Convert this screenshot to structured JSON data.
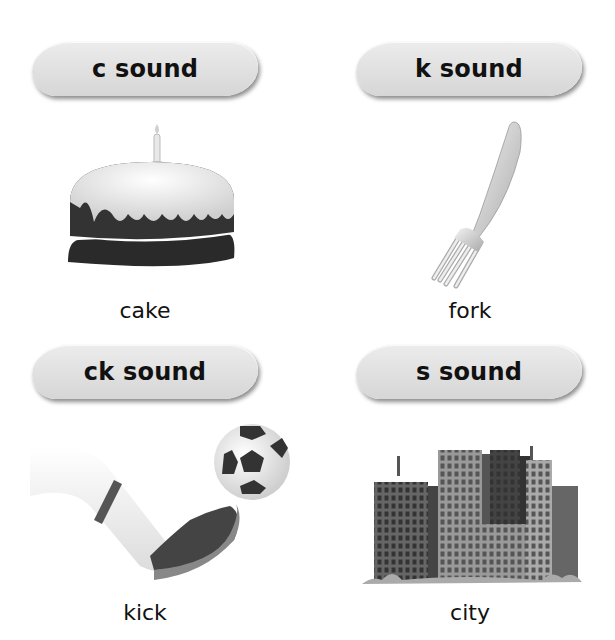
{
  "cards": [
    {
      "heading": "c sound",
      "word": "cake",
      "image": "cake-icon"
    },
    {
      "heading": "k sound",
      "word": "fork",
      "image": "fork-icon"
    },
    {
      "heading": "ck sound",
      "word": "kick",
      "image": "kick-icon"
    },
    {
      "heading": "s sound",
      "word": "city",
      "image": "city-icon"
    }
  ]
}
